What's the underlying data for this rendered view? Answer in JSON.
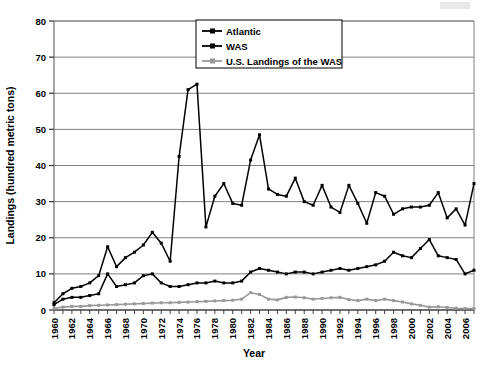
{
  "chart_data": {
    "type": "line",
    "title": "",
    "xlabel": "Year",
    "ylabel": "Landings (hundred metric tons)",
    "xlim": [
      1960,
      2007
    ],
    "ylim": [
      0,
      80
    ],
    "ytick_step": 10,
    "xtick_step": 1,
    "xticklabel_step": 2,
    "grid": true,
    "grid_axis": "y",
    "legend_position": "top-center",
    "yticks": [
      0,
      10,
      20,
      30,
      40,
      50,
      60,
      70,
      80
    ],
    "xticklabels": [
      "1960",
      "1962",
      "1964",
      "1966",
      "1968",
      "1970",
      "1972",
      "1974",
      "1976",
      "1978",
      "1980",
      "1982",
      "1984",
      "1986",
      "1988",
      "1990",
      "1992",
      "1994",
      "1996",
      "1998",
      "2000",
      "2002",
      "2004",
      "2006"
    ],
    "x": [
      1960,
      1961,
      1962,
      1963,
      1964,
      1965,
      1966,
      1967,
      1968,
      1969,
      1970,
      1971,
      1972,
      1973,
      1974,
      1975,
      1976,
      1977,
      1978,
      1979,
      1980,
      1981,
      1982,
      1983,
      1984,
      1985,
      1986,
      1987,
      1988,
      1989,
      1990,
      1991,
      1992,
      1993,
      1994,
      1995,
      1996,
      1997,
      1998,
      1999,
      2000,
      2001,
      2002,
      2003,
      2004,
      2005,
      2006,
      2007
    ],
    "series": [
      {
        "name": "Atlantic",
        "color": "#000000",
        "marker": "square",
        "values": [
          2.0,
          4.5,
          6.0,
          6.5,
          7.5,
          9.5,
          17.5,
          12.0,
          14.5,
          16.0,
          18.0,
          21.5,
          18.5,
          13.5,
          42.5,
          61.0,
          62.5,
          23.0,
          31.5,
          35.0,
          29.5,
          29.0,
          41.5,
          48.5,
          33.5,
          32.0,
          31.5,
          36.5,
          30.0,
          29.0,
          34.5,
          28.5,
          27.0,
          34.5,
          29.5,
          24.0,
          32.5,
          31.5,
          26.5,
          28.0,
          28.5,
          28.5,
          29.0,
          32.5,
          25.5,
          28.0,
          23.5,
          35.0
        ]
      },
      {
        "name": "WAS",
        "color": "#000000",
        "marker": "square",
        "values": [
          1.5,
          3.0,
          3.5,
          3.5,
          4.0,
          4.5,
          10.0,
          6.5,
          7.0,
          7.5,
          9.5,
          10.0,
          7.5,
          6.5,
          6.5,
          7.0,
          7.5,
          7.5,
          8.0,
          7.5,
          7.5,
          8.0,
          10.5,
          11.5,
          11.0,
          10.5,
          10.0,
          10.5,
          10.5,
          10.0,
          10.5,
          11.0,
          11.5,
          11.0,
          11.5,
          12.0,
          12.5,
          13.5,
          16.0,
          15.0,
          14.5,
          17.0,
          19.5,
          15.0,
          14.5,
          14.0,
          10.0,
          11.0
        ]
      },
      {
        "name": "U.S. Landings of the WAS",
        "color": "#999999",
        "marker": "square",
        "values": [
          0.5,
          0.8,
          1.0,
          1.0,
          1.2,
          1.3,
          1.4,
          1.5,
          1.6,
          1.7,
          1.8,
          1.9,
          2.0,
          2.0,
          2.1,
          2.2,
          2.3,
          2.4,
          2.5,
          2.6,
          2.7,
          3.0,
          4.8,
          4.3,
          3.0,
          2.8,
          3.5,
          3.6,
          3.4,
          3.0,
          3.2,
          3.4,
          3.5,
          2.9,
          2.6,
          3.0,
          2.6,
          3.0,
          2.6,
          2.2,
          1.7,
          1.3,
          0.8,
          0.9,
          0.7,
          0.5,
          0.4,
          0.4
        ]
      }
    ]
  }
}
